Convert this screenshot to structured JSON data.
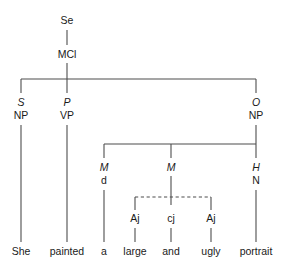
{
  "diagram": {
    "sentence": "She painted a large and ugly portrait",
    "root": {
      "form": "Se"
    },
    "clause": {
      "form": "MCl"
    },
    "level2": [
      {
        "function": "S",
        "form": "NP"
      },
      {
        "function": "P",
        "form": "VP"
      },
      {
        "function": "O",
        "form": "NP"
      }
    ],
    "level3": [
      {
        "function": "M",
        "form": "d"
      },
      {
        "function": "M",
        "form": ""
      },
      {
        "function": "H",
        "form": "N"
      }
    ],
    "coordination": [
      {
        "form": "Aj"
      },
      {
        "form": "cj"
      },
      {
        "form": "Aj"
      }
    ],
    "words": [
      {
        "text": "She"
      },
      {
        "text": "painted"
      },
      {
        "text": "a"
      },
      {
        "text": "large"
      },
      {
        "text": "and"
      },
      {
        "text": "ugly"
      },
      {
        "text": "portrait"
      }
    ],
    "colors": {
      "line": "#4d4d4d",
      "text": "#1a1a1a",
      "background": "#ffffff"
    }
  }
}
